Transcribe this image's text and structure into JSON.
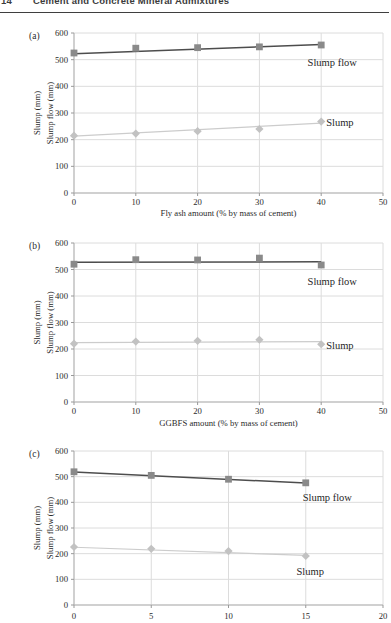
{
  "header": {
    "page_number": "14",
    "title": "Cement and Concrete Mineral Admixtures"
  },
  "colors": {
    "grid": "#dcdcdc",
    "axis": "#b3b3b3",
    "tick_mark": "#999999",
    "text": "#2b2b2b",
    "annotation": "#1f1f1f",
    "slump_flow_line": "#4d4d4d",
    "slump_flow_marker": "#8a8a8a",
    "slump_line": "#cccccc",
    "slump_marker": "#c2c2c2"
  },
  "chart_data": [
    {
      "type": "line",
      "panel_label": "(a)",
      "xlabel": "Fly ash amount (% by mass of cement)",
      "ylabel_lines": [
        "Slump (mm)",
        "Slump flow (mm)"
      ],
      "xlim": [
        0,
        50
      ],
      "xticks": [
        0,
        10,
        20,
        30,
        40,
        50
      ],
      "ylim": [
        0,
        600
      ],
      "yticks": [
        0,
        100,
        200,
        300,
        400,
        500,
        600
      ],
      "grid": true,
      "series": [
        {
          "name": "Slump flow",
          "marker": "square",
          "line_color": "#4d4d4d",
          "line_width": 1.5,
          "marker_color": "#8a8a8a",
          "x": [
            0,
            10,
            20,
            30,
            40
          ],
          "values": [
            525,
            543,
            545,
            548,
            555
          ],
          "trend_x": [
            0,
            40
          ],
          "trend_y": [
            522,
            557
          ],
          "label": {
            "text": "Slump flow",
            "x": 37.8,
            "y": 490
          }
        },
        {
          "name": "Slump",
          "marker": "diamond",
          "line_color": "#cccccc",
          "line_width": 1.2,
          "marker_color": "#c2c2c2",
          "x": [
            0,
            10,
            20,
            30,
            40
          ],
          "values": [
            215,
            223,
            232,
            240,
            268
          ],
          "trend_x": [
            0,
            40
          ],
          "trend_y": [
            213,
            262
          ],
          "label": {
            "text": "Slump",
            "x": 40.8,
            "y": 266
          }
        }
      ]
    },
    {
      "type": "line",
      "panel_label": "(b)",
      "xlabel": "GGBFS amount (% by mass of cement)",
      "ylabel_lines": [
        "Slump (mm)",
        "Slump flow (mm)"
      ],
      "xlim": [
        0,
        50
      ],
      "xticks": [
        0,
        10,
        20,
        30,
        40,
        50
      ],
      "ylim": [
        0,
        600
      ],
      "yticks": [
        0,
        100,
        200,
        300,
        400,
        500,
        600
      ],
      "grid": true,
      "series": [
        {
          "name": "Slump flow",
          "marker": "square",
          "line_color": "#4d4d4d",
          "line_width": 1.5,
          "marker_color": "#8a8a8a",
          "x": [
            0,
            10,
            20,
            30,
            40
          ],
          "values": [
            520,
            537,
            536,
            543,
            517
          ],
          "trend_x": [
            0,
            40
          ],
          "trend_y": [
            527,
            529
          ],
          "label": {
            "text": "Slump flow",
            "x": 37.8,
            "y": 455
          }
        },
        {
          "name": "Slump",
          "marker": "diamond",
          "line_color": "#cccccc",
          "line_width": 1.2,
          "marker_color": "#c2c2c2",
          "x": [
            0,
            10,
            20,
            30,
            40
          ],
          "values": [
            220,
            228,
            231,
            235,
            218
          ],
          "trend_x": [
            0,
            40
          ],
          "trend_y": [
            224,
            228
          ],
          "label": {
            "text": "Slump",
            "x": 40.8,
            "y": 215
          }
        }
      ]
    },
    {
      "type": "line",
      "panel_label": "(c)",
      "xlabel": "",
      "ylabel_lines": [
        "Slump (mm)",
        "Slump flow (mm)"
      ],
      "xlim": [
        0,
        20
      ],
      "xticks": [
        0,
        5,
        10,
        15,
        20
      ],
      "ylim": [
        0,
        600
      ],
      "yticks": [
        0,
        100,
        200,
        300,
        400,
        500,
        600
      ],
      "grid": true,
      "series": [
        {
          "name": "Slump flow",
          "marker": "square",
          "line_color": "#4d4d4d",
          "line_width": 1.5,
          "marker_color": "#8a8a8a",
          "x": [
            0,
            5,
            10,
            15
          ],
          "values": [
            519,
            505,
            490,
            476
          ],
          "trend_x": [
            0,
            15
          ],
          "trend_y": [
            518,
            475
          ],
          "label": {
            "text": "Slump flow",
            "x": 14.8,
            "y": 420
          }
        },
        {
          "name": "Slump",
          "marker": "diamond",
          "line_color": "#cccccc",
          "line_width": 1.2,
          "marker_color": "#c2c2c2",
          "x": [
            0,
            5,
            10,
            15
          ],
          "values": [
            226,
            219,
            210,
            191
          ],
          "trend_x": [
            0,
            15
          ],
          "trend_y": [
            225,
            193
          ],
          "label": {
            "text": "Slump",
            "x": 14.4,
            "y": 130
          }
        }
      ]
    }
  ]
}
